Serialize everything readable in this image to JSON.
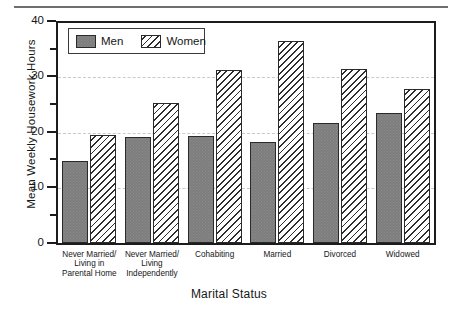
{
  "chart_data": {
    "type": "bar",
    "title": "",
    "xlabel": "Marital Status",
    "ylabel": "Mean Weekly Housework Hours",
    "ylim": [
      0,
      40
    ],
    "yticks": [
      0,
      10,
      20,
      30,
      40
    ],
    "ytick_labels": [
      "0",
      "10",
      "20",
      "30",
      "40"
    ],
    "yminor_ticks": [
      5,
      15,
      25,
      35
    ],
    "grid": "horizontal-dashed",
    "legend_position": "top-left-inside",
    "categories": [
      "Never Married/\nLiving in\nParental Home",
      "Never Married/\nLiving\nIndependently",
      "Cohabiting",
      "Married",
      "Divorced",
      "Widowed"
    ],
    "series": [
      {
        "name": "Men",
        "fill": "solid-gray",
        "color": "#7d7d7d",
        "values": [
          15.0,
          19.3,
          19.5,
          18.4,
          21.8,
          23.6
        ]
      },
      {
        "name": "Women",
        "fill": "diagonal-hatch",
        "color": "#ffffff",
        "values": [
          19.6,
          25.4,
          31.4,
          36.8,
          31.7,
          28.0
        ]
      }
    ]
  },
  "legend": {
    "entries": [
      {
        "label": "Men"
      },
      {
        "label": "Women"
      }
    ]
  },
  "axes": {
    "y_title": "Mean Weekly Housework Hours",
    "x_title": "Marital Status",
    "y_labels": {
      "t0": "0",
      "t10": "10",
      "t20": "20",
      "t30": "30",
      "t40": "40"
    }
  },
  "categories_text": {
    "c0": "Never Married/\nLiving in\nParental Home",
    "c1": "Never Married/\nLiving\nIndependently",
    "c2": "Cohabiting",
    "c3": "Married",
    "c4": "Divorced",
    "c5": "Widowed"
  },
  "colors": {
    "bar_men": "#7d7d7d",
    "bar_women": "#ffffff",
    "hatch": "#2d2d2d",
    "axis": "#1c1c1c",
    "grid": "#c9c9c9",
    "text": "#161616",
    "top_rule": "#6e6e6e"
  }
}
